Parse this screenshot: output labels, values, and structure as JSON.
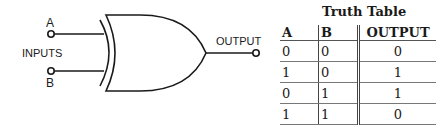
{
  "diagram": {
    "gate_type": "XOR",
    "labels": {
      "input_a": "A",
      "input_b": "B",
      "inputs": "INPUTS",
      "output": "OUTPUT"
    },
    "line_color": "#1a1a1a"
  },
  "truth_table": {
    "title": "Truth Table",
    "headers": [
      "A",
      "B",
      "OUTPUT"
    ],
    "rows": [
      [
        "0",
        "0",
        "0"
      ],
      [
        "1",
        "0",
        "1"
      ],
      [
        "0",
        "1",
        "1"
      ],
      [
        "1",
        "1",
        "0"
      ]
    ]
  }
}
